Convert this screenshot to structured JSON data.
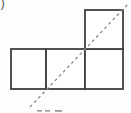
{
  "figure": {
    "top_left_partial_label": ")",
    "canvas": {
      "width": 131,
      "height": 113
    },
    "colors": {
      "background": "#fdfdfd",
      "square_fill": "#ffffff",
      "square_stroke": "#3f3f3f",
      "dashed_line": "#8a8a8a",
      "cutoff_marks": "#9a9a9a",
      "partial_label": "#5a5a5a"
    },
    "squares": [
      {
        "name": "bottom-left-square",
        "x": 11,
        "y": 49,
        "w": 35,
        "h": 40
      },
      {
        "name": "bottom-middle-square",
        "x": 46,
        "y": 49,
        "w": 39,
        "h": 40
      },
      {
        "name": "bottom-right-square",
        "x": 85,
        "y": 49,
        "w": 38,
        "h": 40
      },
      {
        "name": "top-square",
        "x": 85,
        "y": 10,
        "w": 38,
        "h": 39
      }
    ],
    "dashed_line": {
      "x1": 30,
      "y1": 107,
      "x2": 128,
      "y2": 4,
      "dash": "3 3",
      "width": 1.3
    },
    "cutoff_caption_marks": [
      {
        "x": 37,
        "y": 110,
        "w": 5,
        "h": 1.6
      },
      {
        "x": 45,
        "y": 110,
        "w": 5,
        "h": 1.6
      },
      {
        "x": 55,
        "y": 110,
        "w": 7,
        "h": 1.8
      }
    ]
  }
}
